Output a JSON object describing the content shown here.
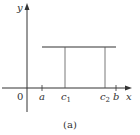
{
  "figure": {
    "caption": "(a)",
    "axes": {
      "x_label": "x",
      "y_label": "y",
      "origin_label": "0"
    },
    "x_ticks": [
      {
        "label": "a",
        "sub": ""
      },
      {
        "label": "c",
        "sub": "1"
      },
      {
        "label": "c",
        "sub": "2"
      },
      {
        "label": "b",
        "sub": ""
      }
    ],
    "colors": {
      "stroke": "#333333",
      "background": "#ffffff"
    }
  }
}
